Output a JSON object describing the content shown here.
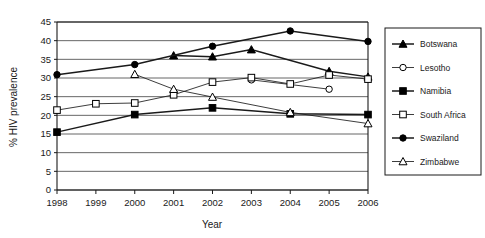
{
  "chart_data": {
    "type": "line",
    "title": "",
    "xlabel": "Year",
    "ylabel": "% HIV prevalence",
    "x": [
      1998,
      1999,
      2000,
      2001,
      2002,
      2003,
      2004,
      2005,
      2006
    ],
    "xtick_labels": [
      "1998",
      "1999",
      "2000",
      "2001",
      "2002",
      "2003",
      "2004",
      "2005",
      "2006"
    ],
    "ytick_labels": [
      "0",
      "5",
      "10",
      "15",
      "20",
      "25",
      "30",
      "35",
      "40",
      "45"
    ],
    "yticks": [
      0,
      5,
      10,
      15,
      20,
      25,
      30,
      35,
      40,
      45
    ],
    "ylim": [
      0,
      45
    ],
    "xlim": [
      1998,
      2006
    ],
    "grid": "horizontal",
    "legend_position": "right",
    "series": [
      {
        "name": "Botswana",
        "marker": "filled-triangle",
        "values": [
          null,
          null,
          null,
          36.0,
          35.7,
          37.6,
          null,
          31.8,
          30.3
        ]
      },
      {
        "name": "Lesotho",
        "marker": "open-circle",
        "values": [
          null,
          null,
          null,
          null,
          null,
          29.5,
          null,
          27.0,
          null
        ]
      },
      {
        "name": "Namibia",
        "marker": "filled-square",
        "values": [
          15.5,
          null,
          20.2,
          null,
          22.0,
          null,
          20.4,
          null,
          20.2
        ]
      },
      {
        "name": "South Africa",
        "marker": "open-square",
        "values": [
          21.4,
          23.1,
          23.3,
          25.5,
          28.9,
          30.1,
          28.4,
          30.8,
          29.7
        ]
      },
      {
        "name": "Swaziland",
        "marker": "filled-circle",
        "values": [
          30.9,
          null,
          33.6,
          null,
          38.5,
          null,
          42.6,
          null,
          39.8
        ]
      },
      {
        "name": "Zimbabwe",
        "marker": "open-triangle",
        "values": [
          null,
          null,
          31.0,
          27.0,
          24.9,
          null,
          20.8,
          null,
          17.8
        ]
      }
    ]
  },
  "legend": {
    "items": [
      {
        "label": "Botswana",
        "marker": "filled-triangle"
      },
      {
        "label": "Lesotho",
        "marker": "open-circle"
      },
      {
        "label": "Namibia",
        "marker": "filled-square"
      },
      {
        "label": "South Africa",
        "marker": "open-square"
      },
      {
        "label": "Swaziland",
        "marker": "filled-circle"
      },
      {
        "label": "Zimbabwe",
        "marker": "open-triangle"
      }
    ]
  },
  "colors": {
    "line": "#1a1a1a",
    "grid": "#555555",
    "axis": "#1a1a1a",
    "background": "#ffffff",
    "marker_fill": "#000000",
    "marker_open": "#ffffff"
  }
}
